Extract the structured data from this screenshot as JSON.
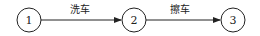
{
  "diagram": {
    "type": "activity-on-arrow network",
    "nodes": [
      {
        "id": "1",
        "label": "1",
        "cx": 29,
        "cy": 20
      },
      {
        "id": "2",
        "label": "2",
        "cx": 134,
        "cy": 20
      },
      {
        "id": "3",
        "label": "3",
        "cx": 233,
        "cy": 20
      }
    ],
    "edges": [
      {
        "from": "1",
        "to": "2",
        "label": "洗车"
      },
      {
        "from": "2",
        "to": "3",
        "label": "擦车"
      }
    ],
    "colors": {
      "stroke": "#222222",
      "background": "#ffffff"
    }
  }
}
